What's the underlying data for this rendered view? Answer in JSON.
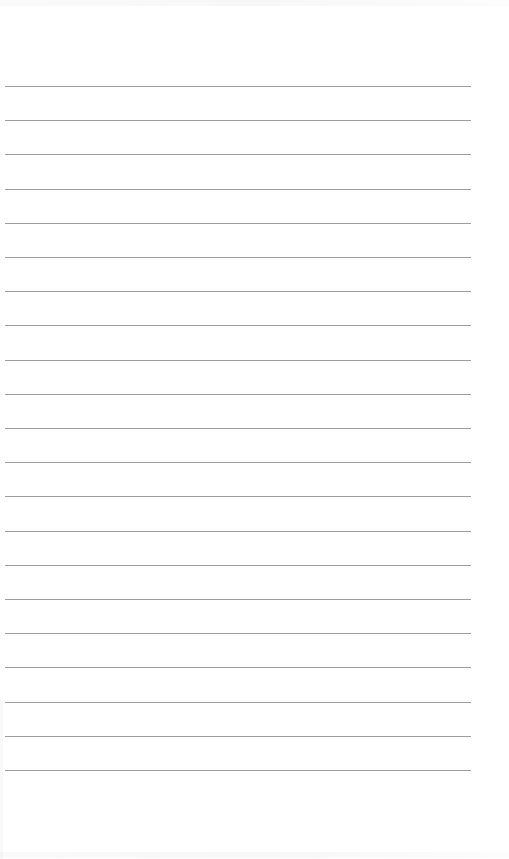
{
  "document": {
    "type": "blank lined notebook page",
    "ruled_lines": {
      "count": 21,
      "first_line_y": 86,
      "spacing_px": 34.2,
      "left_x": 5,
      "width": 466,
      "color": "#9c9c9c"
    },
    "background_color": "#ffffff",
    "text_content": []
  }
}
